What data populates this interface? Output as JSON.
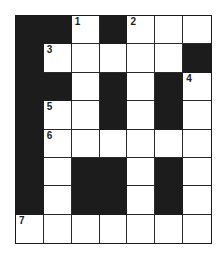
{
  "puzzle": {
    "rows": 8,
    "cols": 7,
    "layout": [
      "BBWBWWW",
      "BWWWWWB",
      "BBWBWBW",
      "BWWBWBW",
      "BWWWWWW",
      "BWBBWBW",
      "BWBBWBW",
      "WWWWWWW"
    ],
    "numbers": [
      {
        "row": 0,
        "col": 2,
        "label": "1"
      },
      {
        "row": 0,
        "col": 4,
        "label": "2"
      },
      {
        "row": 1,
        "col": 1,
        "label": "3"
      },
      {
        "row": 2,
        "col": 6,
        "label": "4"
      },
      {
        "row": 3,
        "col": 1,
        "label": "5"
      },
      {
        "row": 4,
        "col": 1,
        "label": "6"
      },
      {
        "row": 7,
        "col": 0,
        "label": "7"
      }
    ],
    "colors": {
      "block": "#1c1c1c",
      "open": "#ffffff"
    }
  }
}
